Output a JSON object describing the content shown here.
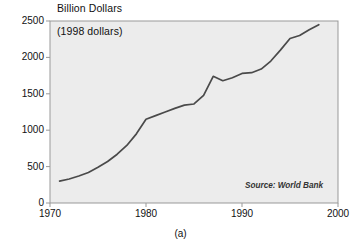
{
  "figure": {
    "caption": "(a)",
    "axis_title": "Billion Dollars",
    "plot_annotation": "(1998 dollars)",
    "source_note": "Source: World Bank",
    "colors": {
      "page_background": "#ffffff",
      "plot_background": "#ececec",
      "plot_border": "#999999",
      "line": "#4a4a4a",
      "text": "#111111"
    }
  },
  "chart_data": {
    "type": "line",
    "title": "Billion Dollars",
    "subtitle": "(1998 dollars)",
    "annotation": "Source: World Bank",
    "xlabel": "",
    "ylabel": "Billion Dollars",
    "ylim": [
      0,
      2500
    ],
    "xlim": [
      1970,
      2000
    ],
    "grid": false,
    "legend": "none",
    "xticks": [
      "1970",
      "1980",
      "1990",
      "2000"
    ],
    "xtick_values": [
      1970,
      1980,
      1990,
      2000
    ],
    "yticks": [
      "0",
      "500",
      "1000",
      "1500",
      "2000",
      "2500"
    ],
    "ytick_values": [
      0,
      500,
      1000,
      1500,
      2000,
      2500
    ],
    "series": [
      {
        "name": "Billion Dollars (1998 dollars)",
        "x": [
          1971,
          1972,
          1973,
          1974,
          1975,
          1976,
          1977,
          1978,
          1979,
          1980,
          1981,
          1982,
          1983,
          1984,
          1985,
          1986,
          1987,
          1988,
          1989,
          1990,
          1991,
          1992,
          1993,
          1994,
          1995,
          1996,
          1997,
          1998
        ],
        "values": [
          300,
          330,
          370,
          420,
          490,
          570,
          670,
          790,
          950,
          1150,
          1200,
          1250,
          1300,
          1345,
          1360,
          1480,
          1740,
          1680,
          1720,
          1780,
          1790,
          1840,
          1950,
          2100,
          2260,
          2300,
          2380,
          2450
        ]
      }
    ]
  }
}
